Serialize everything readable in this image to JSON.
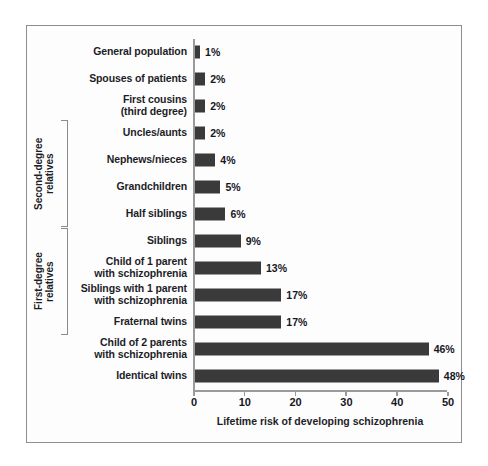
{
  "chart_data": {
    "type": "bar",
    "orientation": "horizontal",
    "title": "",
    "xlabel": "Lifetime risk of developing schizophrenia",
    "ylabel": "",
    "xlim": [
      0,
      52
    ],
    "xticks": [
      0,
      10,
      20,
      30,
      40,
      50
    ],
    "xtick_labels": [
      "0",
      "10",
      "20",
      "30",
      "40",
      "50"
    ],
    "grid": false,
    "legend": false,
    "bar_color": "#3a3a3a",
    "value_suffix": "%",
    "categories": [
      "General population",
      "Spouses of patients",
      "First cousins\n(third degree)",
      "Uncles/aunts",
      "Nephews/nieces",
      "Grandchildren",
      "Half siblings",
      "Siblings",
      "Child of 1 parent\nwith schizophrenia",
      "Siblings with 1 parent\nwith schizophrenia",
      "Fraternal twins",
      "Child of 2 parents\nwith schizophrenia",
      "Identical twins"
    ],
    "values": [
      1,
      2,
      2,
      2,
      4,
      5,
      6,
      9,
      13,
      17,
      17,
      46,
      48
    ],
    "value_labels": [
      "1%",
      "2%",
      "2%",
      "2%",
      "4%",
      "5%",
      "6%",
      "9%",
      "13%",
      "17%",
      "17%",
      "46%",
      "48%"
    ],
    "group_brackets": [
      {
        "label": "Second-degree\nrelatives",
        "first_index": 3,
        "last_index": 6
      },
      {
        "label": "First-degree\nrelatives",
        "first_index": 7,
        "last_index": 10
      }
    ]
  }
}
